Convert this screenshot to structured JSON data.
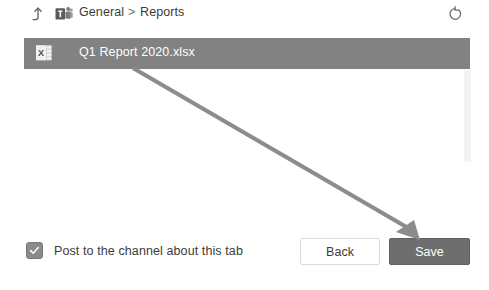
{
  "window": {
    "background_color": "#ffffff"
  },
  "breadcrumb": {
    "up_level_icon": "arrow-up-icon",
    "app_icon": "teams-logo-icon",
    "items": [
      {
        "label": "General"
      },
      {
        "label": "Reports"
      }
    ],
    "separator": ">",
    "refresh_icon": "refresh-icon"
  },
  "file_list": {
    "items": [
      {
        "name": "Q1 Report 2020.xlsx",
        "file_icon": "excel-file-icon",
        "selected": true,
        "selected_color": "#828282"
      }
    ],
    "scrollbar": {
      "name": "vertical-scrollbar",
      "thumb_color": "#e2e2e2"
    }
  },
  "footer": {
    "post_to_channel": {
      "label": "Post to the channel about this tab",
      "checked": true,
      "check_glyph": "✓"
    },
    "back_label": "Back",
    "save_label": "Save",
    "save_color": "#6e6e6e"
  },
  "annotation": {
    "arrow_color": "#8c8c8c",
    "points_to": "save-button"
  }
}
